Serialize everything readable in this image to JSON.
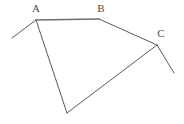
{
  "figure": {
    "name": "labeled-polyline-figure",
    "width": 184,
    "height": 124,
    "background_color": "#ffffff",
    "stroke_color": "#5a5a5a",
    "stroke_color_emphasis": "#6e6e6e",
    "label_color": "#4a4a4a",
    "vertices": [
      {
        "id": "tail_left",
        "label": "",
        "x": 12,
        "y": 38
      },
      {
        "id": "A",
        "label": "A",
        "x": 36,
        "y": 20
      },
      {
        "id": "B",
        "label": "B",
        "x": 99,
        "y": 19
      },
      {
        "id": "C",
        "label": "C",
        "x": 157,
        "y": 45
      },
      {
        "id": "tail_right",
        "label": "",
        "x": 174,
        "y": 73
      },
      {
        "id": "D",
        "label": "",
        "x": 67,
        "y": 113
      }
    ],
    "segments": [
      {
        "id": "seg-tail-left-A",
        "from": "tail_left",
        "to": "A",
        "x1": 12,
        "y1": 38,
        "x2": 36,
        "y2": 20,
        "width": 1.0
      },
      {
        "id": "seg-A-B",
        "from": "A",
        "to": "B",
        "x1": 36,
        "y1": 20,
        "x2": 99,
        "y2": 19,
        "width": 1.6
      },
      {
        "id": "seg-B-C",
        "from": "B",
        "to": "C",
        "x1": 99,
        "y1": 19,
        "x2": 157,
        "y2": 45,
        "width": 1.0
      },
      {
        "id": "seg-C-tail-right",
        "from": "C",
        "to": "tail_right",
        "x1": 157,
        "y1": 45,
        "x2": 174,
        "y2": 73,
        "width": 1.0
      },
      {
        "id": "seg-A-D",
        "from": "A",
        "to": "D",
        "x1": 36,
        "y1": 20,
        "x2": 67,
        "y2": 113,
        "width": 1.0
      },
      {
        "id": "seg-D-C",
        "from": "D",
        "to": "C",
        "x1": 67,
        "y1": 113,
        "x2": 157,
        "y2": 45,
        "width": 1.0
      }
    ],
    "labels": [
      {
        "id": "label-A",
        "text": "A",
        "x": 36,
        "y": 3
      },
      {
        "id": "label-B",
        "text": "B",
        "x": 101,
        "y": 3
      },
      {
        "id": "label-C",
        "text": "C",
        "x": 161,
        "y": 28
      }
    ]
  }
}
